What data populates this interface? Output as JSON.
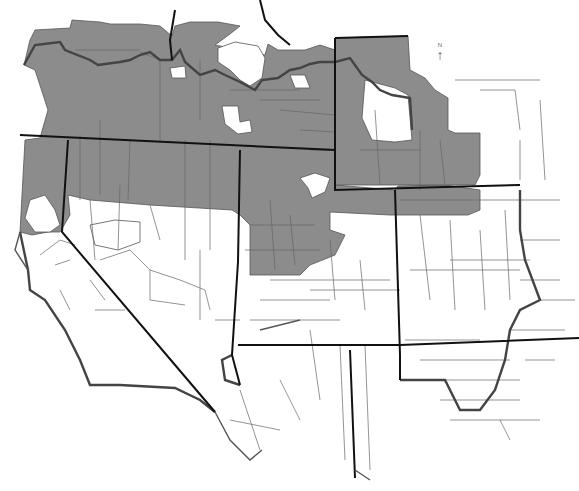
{
  "map": {
    "title": "Western United States county map",
    "description": "County-level map of western US states with selected counties shaded gray",
    "north_arrow": {
      "label": "N",
      "glyph": "↑"
    },
    "colors": {
      "shaded_fill": "#8c8c8c",
      "unshaded_fill": "#ffffff",
      "state_border": "#111111",
      "county_border": "#555555",
      "region_boundary": "#444444"
    },
    "legend": {
      "shaded": "Shaded counties",
      "unshaded": "Unshaded counties"
    }
  }
}
